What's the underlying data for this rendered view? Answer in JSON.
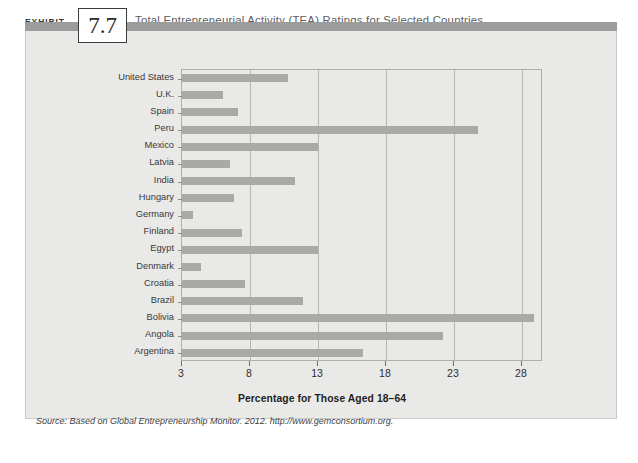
{
  "header": {
    "exhibit_word": "EXHIBIT",
    "exhibit_number": "7.7",
    "title": "Total Entrepreneurial Activity (TEA) Ratings for Selected Countries",
    "band_color": "#9c9c9c"
  },
  "panel": {
    "background_color": "#e9e9e7",
    "source": "Source: Based on Global Entrepreneurship Monitor. 2012. http://www.gemconsortium.org."
  },
  "chart_data": {
    "type": "bar",
    "orientation": "horizontal",
    "title": "Total Entrepreneurial Activity (TEA) Ratings for Selected Countries",
    "xlabel": "Percentage for Those Aged 18–64",
    "ylabel": "",
    "xlim": [
      3,
      29.55
    ],
    "xticks": [
      3,
      8,
      13,
      18,
      23,
      28
    ],
    "xticklabels": [
      "3",
      "8",
      "13",
      "18",
      "23",
      "28"
    ],
    "grid": true,
    "legend": null,
    "bar_color": "#a9a9a7",
    "categories": [
      "United States",
      "U.K.",
      "Spain",
      "Peru",
      "Mexico",
      "Latvia",
      "India",
      "Hungary",
      "Germany",
      "Finland",
      "Egypt",
      "Denmark",
      "Croatia",
      "Brazil",
      "Bolivia",
      "Angola",
      "Argentina"
    ],
    "values": [
      10.8,
      6.0,
      7.1,
      24.8,
      13.0,
      6.5,
      11.3,
      6.8,
      3.8,
      7.4,
      13.0,
      4.4,
      7.6,
      11.9,
      28.9,
      22.2,
      16.3
    ]
  }
}
